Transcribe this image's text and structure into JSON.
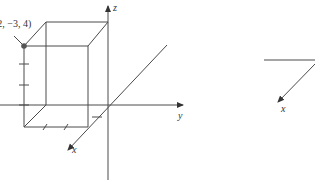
{
  "figure": {
    "left_diagram": {
      "point_label": "(2, −3, 4)",
      "point_coords": {
        "x": 2,
        "y": -3,
        "z": 4
      },
      "axis_labels": {
        "x": "x",
        "y": "y",
        "z": "z"
      },
      "point_color": "#555555"
    },
    "right_diagram": {
      "axis_labels": {
        "x": "x"
      }
    }
  }
}
